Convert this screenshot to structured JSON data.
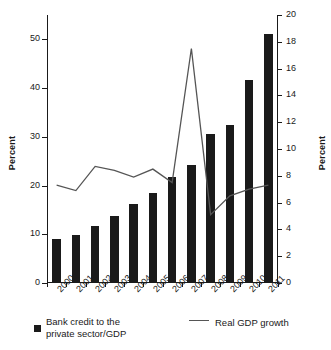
{
  "chart_data": {
    "type": "bar",
    "title": "",
    "xlabel": "",
    "ylabel": "Percent",
    "y2label": "Percent",
    "categories": [
      "2000",
      "2001",
      "2002",
      "2003",
      "2004",
      "2005",
      "2006",
      "2007",
      "2008",
      "2009",
      "2010",
      "2011"
    ],
    "ylim": [
      0,
      55
    ],
    "y2lim": [
      0,
      20
    ],
    "yticks": [
      0,
      10,
      20,
      30,
      40,
      50
    ],
    "y2ticks": [
      0,
      2,
      4,
      6,
      8,
      10,
      12,
      14,
      16,
      18,
      20
    ],
    "grid": false,
    "legend_position": "bottom",
    "series": [
      {
        "name": "Bank credit to the private sector/GDP",
        "type": "bar",
        "axis": "left",
        "color": "#1a1a1a",
        "values": [
          8.8,
          9.7,
          11.5,
          13.6,
          16.0,
          18.3,
          21.6,
          24.1,
          30.3,
          32.3,
          41.4,
          50.9
        ]
      },
      {
        "name": "Real GDP growth",
        "type": "line",
        "axis": "right",
        "color": "#555555",
        "values": [
          7.3,
          6.9,
          8.7,
          8.4,
          7.9,
          8.5,
          7.5,
          17.5,
          5.1,
          6.5,
          7.0,
          7.3
        ]
      }
    ]
  },
  "axes": {
    "left": {
      "title": "Percent",
      "ticks": [
        "0",
        "10",
        "20",
        "30",
        "40",
        "50"
      ]
    },
    "right": {
      "title": "Percent",
      "ticks": [
        "0",
        "2",
        "4",
        "6",
        "8",
        "10",
        "12",
        "14",
        "16",
        "18",
        "20"
      ]
    },
    "x": {
      "ticks": [
        "2000",
        "2001",
        "2002",
        "2003",
        "2004",
        "2005",
        "2006",
        "2007",
        "2008",
        "2009",
        "2010",
        "2011"
      ]
    }
  },
  "legend": {
    "bars_label_line1": "Bank credit to the",
    "bars_label_line2": "private sector/GDP",
    "bars_label": "Bank credit to the private sector/GDP",
    "line_label": "Real GDP growth"
  }
}
